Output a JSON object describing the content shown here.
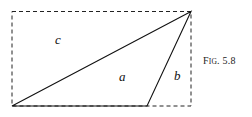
{
  "figure": {
    "caption_prefix": "F",
    "caption_smallcaps": "IG",
    "caption_rest": ". 5.8",
    "labels": {
      "c": "c",
      "a": "a",
      "b": "b"
    },
    "rectangle": {
      "x1": 12,
      "y1": 12,
      "x2": 191,
      "y2": 106,
      "style": "dashed"
    },
    "triangle": [
      [
        12,
        106
      ],
      [
        147,
        106
      ],
      [
        191,
        12
      ]
    ],
    "line_color": "#111111"
  }
}
